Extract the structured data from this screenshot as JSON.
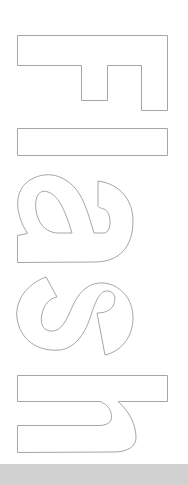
{
  "logo": {
    "text": "Flash",
    "orientation": "rotated 90deg clockwise",
    "style": "outlined letters",
    "stroke_color": "#a6a6a6",
    "fill_color": "#ffffff",
    "letters": [
      "F",
      "l",
      "a",
      "s",
      "h"
    ]
  },
  "bottom_bar": {
    "color": "#d1d1d1"
  },
  "background_color": "#ffffff"
}
